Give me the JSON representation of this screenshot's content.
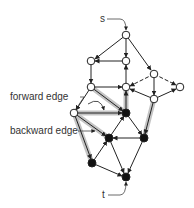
{
  "diagram": {
    "type": "flow-network-residual-path",
    "labels": {
      "source": "s",
      "sink": "t",
      "forward_edge": "forward edge",
      "backward_edge": "backward edge"
    },
    "colors": {
      "open_node_fill": "#ffffff",
      "filled_node_fill": "#111111",
      "edge": "#222222",
      "highlight": "#bdbdbd"
    },
    "nodes": [
      {
        "id": "s",
        "x": 126,
        "y": 35,
        "filled": false
      },
      {
        "id": "a",
        "x": 91,
        "y": 61,
        "filled": false
      },
      {
        "id": "b",
        "x": 126,
        "y": 61,
        "filled": false
      },
      {
        "id": "c",
        "x": 154,
        "y": 74,
        "filled": false
      },
      {
        "id": "d",
        "x": 180,
        "y": 87,
        "filled": false
      },
      {
        "id": "e",
        "x": 91,
        "y": 87,
        "filled": false
      },
      {
        "id": "f",
        "x": 126,
        "y": 87,
        "filled": false
      },
      {
        "id": "g",
        "x": 154,
        "y": 99,
        "filled": false
      },
      {
        "id": "h",
        "x": 74,
        "y": 113,
        "filled": false
      },
      {
        "id": "i",
        "x": 126,
        "y": 113,
        "filled": true
      },
      {
        "id": "j",
        "x": 109,
        "y": 138,
        "filled": true
      },
      {
        "id": "k",
        "x": 144,
        "y": 138,
        "filled": true
      },
      {
        "id": "l",
        "x": 92,
        "y": 163,
        "filled": true
      },
      {
        "id": "t",
        "x": 126,
        "y": 177,
        "filled": true
      }
    ],
    "edges": [
      {
        "from": "s",
        "to": "a"
      },
      {
        "from": "s",
        "to": "b"
      },
      {
        "from": "s",
        "to": "c"
      },
      {
        "from": "b",
        "to": "a"
      },
      {
        "from": "a",
        "to": "e"
      },
      {
        "from": "f",
        "to": "b"
      },
      {
        "from": "e",
        "to": "f"
      },
      {
        "from": "c",
        "to": "f",
        "dashed": true
      },
      {
        "from": "c",
        "to": "d",
        "dashed": true
      },
      {
        "from": "c",
        "to": "g"
      },
      {
        "from": "g",
        "to": "d"
      },
      {
        "from": "g",
        "to": "f"
      },
      {
        "from": "e",
        "to": "h"
      },
      {
        "from": "e",
        "to": "i",
        "highlight": true
      },
      {
        "from": "i",
        "to": "f",
        "highlight": true
      },
      {
        "from": "h",
        "to": "i",
        "highlight": true
      },
      {
        "from": "h",
        "to": "j",
        "highlight": true
      },
      {
        "from": "h",
        "to": "l",
        "highlight": true
      },
      {
        "from": "j",
        "to": "i"
      },
      {
        "from": "i",
        "to": "k"
      },
      {
        "from": "g",
        "to": "k",
        "highlight": true
      },
      {
        "from": "k",
        "to": "j"
      },
      {
        "from": "l",
        "to": "j"
      },
      {
        "from": "j",
        "to": "t"
      },
      {
        "from": "l",
        "to": "t"
      },
      {
        "from": "k",
        "to": "t"
      }
    ]
  }
}
